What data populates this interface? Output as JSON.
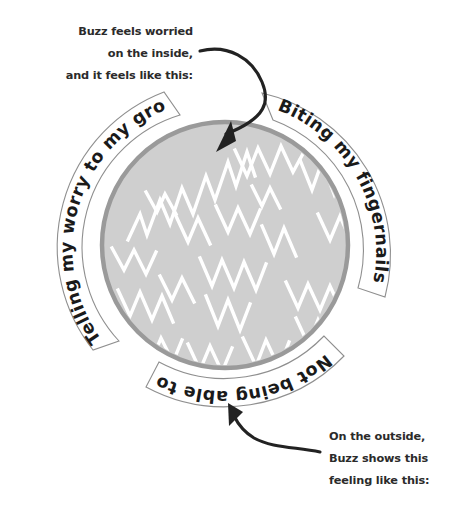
{
  "figure": {
    "colors": {
      "background": "#ffffff",
      "circle_fill": "#cfcfcf",
      "circle_ring": "#9a9a9a",
      "scribble": "#ffffff",
      "text_dark": "#2b2b2b",
      "banner_fill": "#ffffff",
      "banner_outline": "#8f8f8f",
      "arrow": "#222222"
    },
    "circle": {
      "center_x": 225,
      "center_y": 245,
      "radius": 125
    }
  },
  "callouts": {
    "inside": {
      "name": "inside-feeling-callout",
      "lines": [
        "Buzz feels worried",
        "on the inside,",
        "and it feels like this:"
      ]
    },
    "outside": {
      "name": "outside-behavior-callout",
      "lines": [
        "On the outside,",
        "Buzz shows this",
        "feeling like this:"
      ]
    }
  },
  "banners": [
    {
      "id": "banner-biting-fingernails",
      "label": "Biting my fingernails",
      "position": "top-right"
    },
    {
      "id": "banner-not-sit-still",
      "label": "Not being able to sit still",
      "position": "bottom"
    },
    {
      "id": "banner-telling-grown-up",
      "label": "Telling my worry to my grown-up",
      "position": "left"
    }
  ],
  "icons": {
    "arrow_to_inside": "arrow-curved-down-right-icon",
    "arrow_to_outside": "arrow-curved-up-left-icon",
    "scribble": "zigzag-scribble-icon"
  }
}
